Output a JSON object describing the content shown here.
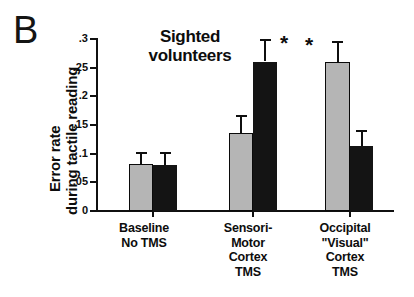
{
  "panel": {
    "letter": "B"
  },
  "chart": {
    "title_line1": "Sighted",
    "title_line2": "volunteers",
    "ylabel_line1": "Error rate",
    "ylabel_line2": "during tactile reading"
  },
  "chart_data": {
    "type": "bar",
    "title": "Sighted volunteers",
    "panel_label": "B",
    "xlabel": "",
    "ylabel": "Error rate during tactile reading",
    "ylim": [
      0,
      0.3
    ],
    "yticks": [
      0,
      0.05,
      0.1,
      0.15,
      0.2,
      0.25,
      0.3
    ],
    "ytick_labels": [
      "0",
      ".05",
      ".1",
      ".15",
      ".2",
      ".25",
      ".3"
    ],
    "grid": false,
    "legend_position": "none",
    "categories": [
      "Baseline No TMS",
      "Sensori-Motor Cortex TMS",
      "Occipital \"Visual\" Cortex TMS"
    ],
    "category_lines": [
      [
        "Baseline",
        "No TMS"
      ],
      [
        "Sensori-",
        "Motor",
        "Cortex",
        "TMS"
      ],
      [
        "Occipital",
        "\"Visual\"",
        "Cortex",
        "TMS"
      ]
    ],
    "series": [
      {
        "name": "gray",
        "color": "#b5b5b5",
        "values": [
          0.08,
          0.135,
          0.259
        ],
        "errors_upper": [
          0.022,
          0.03,
          0.035
        ],
        "significant": [
          false,
          false,
          true
        ]
      },
      {
        "name": "black",
        "color": "#141414",
        "values": [
          0.078,
          0.259,
          0.112
        ],
        "errors_upper": [
          0.024,
          0.04,
          0.028
        ],
        "significant": [
          false,
          true,
          false
        ]
      }
    ],
    "annotations": [
      {
        "text": "*",
        "group": 1,
        "series": "black",
        "side": "right"
      },
      {
        "text": "*",
        "group": 2,
        "series": "gray",
        "side": "left"
      }
    ]
  },
  "geometry": {
    "plot_left": 96,
    "plot_top": 38,
    "plot_height": 172,
    "y_zero_px": 210,
    "bars": [
      {
        "group": 0,
        "series": "gray",
        "x": 33,
        "w": 24
      },
      {
        "group": 0,
        "series": "black",
        "x": 57,
        "w": 24
      },
      {
        "group": 1,
        "series": "gray",
        "x": 133,
        "w": 24
      },
      {
        "group": 1,
        "series": "black",
        "x": 157,
        "w": 24
      },
      {
        "group": 2,
        "series": "gray",
        "x": 229,
        "w": 25
      },
      {
        "group": 2,
        "series": "black",
        "x": 254,
        "w": 23
      }
    ],
    "xticks": [
      57,
      157,
      254
    ],
    "group_label_x": [
      102,
      206,
      300
    ],
    "group_label_w": [
      84,
      84,
      90
    ]
  }
}
